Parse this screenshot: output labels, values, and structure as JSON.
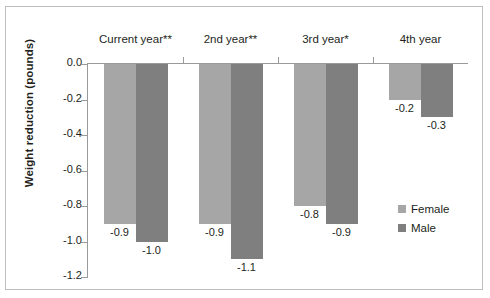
{
  "chart_data": {
    "type": "bar",
    "title": "",
    "xlabel": "",
    "ylabel": "Weight reduction (pounds)",
    "categories": [
      "Current year**",
      "2nd year**",
      "3rd year*",
      "4th year"
    ],
    "series": [
      {
        "name": "Female",
        "color": "#a6a6a6",
        "values": [
          -0.9,
          -0.9,
          -0.8,
          -0.2
        ]
      },
      {
        "name": "Male",
        "color": "#7f7f7f",
        "values": [
          -1.0,
          -1.1,
          -0.9,
          -0.3
        ]
      }
    ],
    "data_labels": {
      "female": [
        "-0.9",
        "-0.9",
        "-0.8",
        "-0.2"
      ],
      "male": [
        "-1.0",
        "-1.1",
        "-0.9",
        "-0.3"
      ]
    },
    "ylim": [
      -1.2,
      0.0
    ],
    "yticks": [
      "0.0",
      "-0.2",
      "-0.4",
      "-0.6",
      "-0.8",
      "-1.0",
      "-1.2"
    ],
    "ytick_values": [
      0.0,
      -0.2,
      -0.4,
      -0.6,
      -0.8,
      -1.0,
      -1.2
    ],
    "grid": false,
    "legend_position": "right",
    "legend": [
      "Female",
      "Male"
    ],
    "category_label_position": "top"
  }
}
